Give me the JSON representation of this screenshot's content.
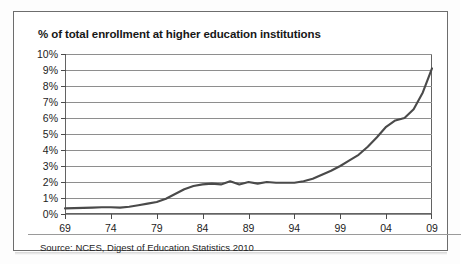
{
  "figure": {
    "title": "% of total enrollment at higher education institutions",
    "source": "Source: NCES, Digest of Education Statistics 2010"
  },
  "colors": {
    "frame_border": "#6d6d6d",
    "plot_border": "#636363",
    "gridline": "#8e8e8e",
    "series_line": "#4a4a4a",
    "text": "#1c1c1c",
    "background": "#ffffff"
  },
  "chart_data": {
    "type": "line",
    "title": "% of total enrollment at higher education institutions",
    "subtitle": "",
    "xlabel": "",
    "ylabel": "",
    "xlim": [
      1969,
      2009
    ],
    "ylim": [
      0,
      10
    ],
    "grid": true,
    "legend_position": "none",
    "y_tick_labels": [
      "10%",
      "9%",
      "8%",
      "7%",
      "6%",
      "5%",
      "4%",
      "3%",
      "2%",
      "1%",
      "0%"
    ],
    "y_tick_values": [
      10,
      9,
      8,
      7,
      6,
      5,
      4,
      3,
      2,
      1,
      0
    ],
    "x_tick_labels": [
      "69",
      "74",
      "79",
      "84",
      "89",
      "94",
      "99",
      "04",
      "09"
    ],
    "x_tick_values": [
      1969,
      1974,
      1979,
      1984,
      1989,
      1994,
      1999,
      2004,
      2009
    ],
    "annotations": [],
    "series": [
      {
        "name": "% of total enrollment at higher education institutions",
        "x": [
          1969,
          1970,
          1971,
          1972,
          1973,
          1974,
          1975,
          1976,
          1977,
          1978,
          1979,
          1980,
          1981,
          1982,
          1983,
          1984,
          1985,
          1986,
          1987,
          1988,
          1989,
          1990,
          1991,
          1992,
          1993,
          1994,
          1995,
          1996,
          1997,
          1998,
          1999,
          2000,
          2001,
          2002,
          2003,
          2004,
          2005,
          2006,
          2007,
          2008,
          2009
        ],
        "values": [
          0.35,
          0.37,
          0.38,
          0.4,
          0.42,
          0.42,
          0.4,
          0.45,
          0.55,
          0.65,
          0.75,
          0.95,
          1.25,
          1.55,
          1.75,
          1.85,
          1.9,
          1.85,
          2.05,
          1.85,
          2.0,
          1.9,
          2.0,
          1.95,
          1.95,
          1.95,
          2.05,
          2.2,
          2.45,
          2.7,
          3.0,
          3.35,
          3.7,
          4.2,
          4.8,
          5.45,
          5.85,
          6.0,
          6.55,
          7.6,
          9.1
        ]
      }
    ]
  }
}
